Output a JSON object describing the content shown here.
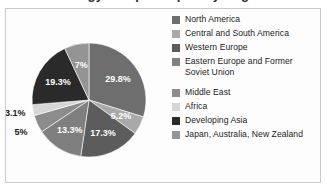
{
  "chart_data": {
    "type": "pie",
    "title": "Energy Use per Capita by Region",
    "categories": [
      "North America",
      "Central and South America",
      "Western Europe",
      "Eastern Europe and Former Soviet Union",
      "Middle East",
      "Africa",
      "Developing Asia",
      "Japan, Australia, New Zealand"
    ],
    "values": [
      29.8,
      5.2,
      17.3,
      13.3,
      5,
      3.1,
      19.3,
      7
    ],
    "value_labels": [
      "29.8%",
      "5.2%",
      "17.3%",
      "13.3%",
      "5%",
      "3.1%",
      "19.3%",
      "7%"
    ],
    "colors": [
      "#6e6e6e",
      "#a9a9a9",
      "#5c5c5c",
      "#7f7f7f",
      "#8c8c8c",
      "#d6d6d6",
      "#2a2a2a",
      "#949494"
    ],
    "label_colors": [
      "#ffffff",
      "#ffffff",
      "#ffffff",
      "#ffffff",
      "#1b1b1b",
      "#1b1b1b",
      "#ffffff",
      "#ffffff"
    ],
    "label_placement": [
      "inside",
      "inside",
      "inside",
      "inside",
      "outside",
      "outside",
      "inside",
      "inside"
    ],
    "start_angle": 0,
    "direction": "clockwise",
    "legend_position": "right",
    "grid": false,
    "xlabel": "",
    "ylabel": ""
  },
  "legend": {
    "items": [
      {
        "label": "North America",
        "color": "#6e6e6e",
        "gap_after": false
      },
      {
        "label": "Central and South America",
        "color": "#a9a9a9",
        "gap_after": false
      },
      {
        "label": "Western Europe",
        "color": "#5c5c5c",
        "gap_after": false
      },
      {
        "label": "Eastern Europe and Former\nSoviet Union",
        "color": "#7f7f7f",
        "gap_after": true
      },
      {
        "label": "Middle East",
        "color": "#8c8c8c",
        "gap_after": false
      },
      {
        "label": "Africa",
        "color": "#d6d6d6",
        "gap_after": false
      },
      {
        "label": "Developing Asia",
        "color": "#2a2a2a",
        "gap_after": false
      },
      {
        "label": "Japan, Australia, New Zealand",
        "color": "#949494",
        "gap_after": false
      }
    ]
  },
  "geometry": {
    "cx": 83,
    "cy": 90,
    "r": 57
  }
}
